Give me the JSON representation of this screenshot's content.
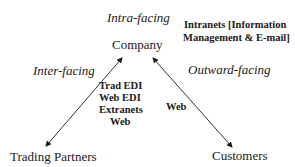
{
  "diagram": {
    "nodes": {
      "company": "Company",
      "trading_partners": "Trading Partners",
      "customers": "Customers"
    },
    "edge_labels": {
      "intra": "Intra-facing",
      "inter": "Inter-facing",
      "outward": "Outward-facing"
    },
    "technologies": {
      "intranets_line1": "Intranets [Information",
      "intranets_line2": "Management & E-mail]",
      "inter": [
        "Trad EDI",
        "Web EDI",
        "Extranets",
        "Web"
      ],
      "outward": "Web"
    },
    "edges": [
      {
        "from": "Company",
        "to": "Trading Partners",
        "arrows": "both"
      },
      {
        "from": "Company",
        "to": "Customers",
        "arrows": "both"
      }
    ]
  }
}
